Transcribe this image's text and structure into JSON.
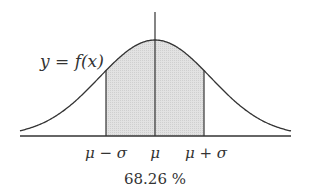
{
  "chart_data": {
    "type": "area",
    "title": "",
    "curve_label": "y = f(x)",
    "x_tick_labels": [
      "μ − σ",
      "μ",
      "μ + σ"
    ],
    "shaded_region": {
      "from": "μ − σ",
      "to": "μ + σ"
    },
    "annotation": "68.26 %",
    "grid": false,
    "colors": {
      "curve": "#333333",
      "fill": "#d9d9d9",
      "axis": "#333333"
    }
  },
  "labels": {
    "curve": "y = f(x)",
    "tick_left": "μ − σ",
    "tick_mid": "μ",
    "tick_right": "μ + σ",
    "percent": "68.26 %"
  }
}
